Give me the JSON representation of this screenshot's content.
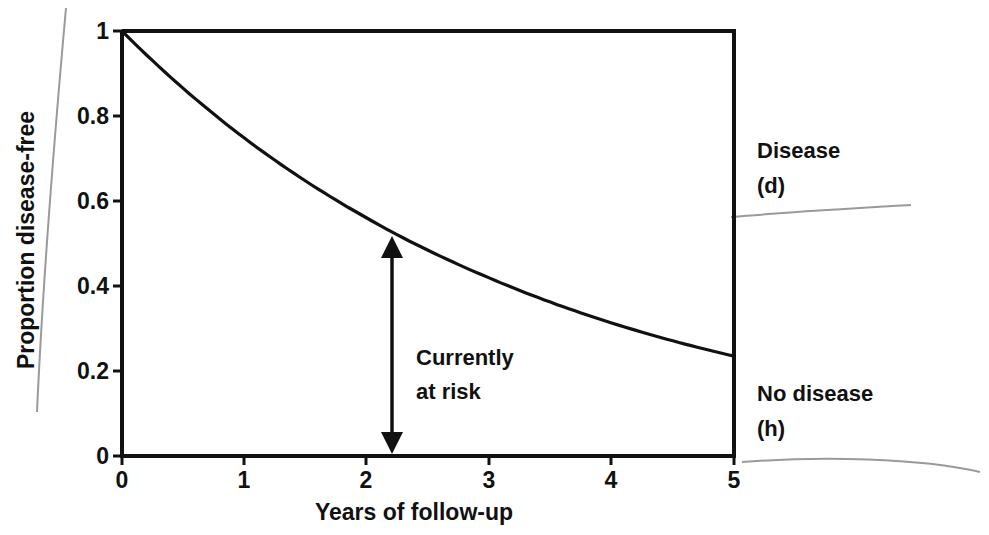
{
  "chart_data": {
    "type": "line",
    "title": "",
    "xlabel": "Years of follow-up",
    "ylabel": "Proportion disease-free",
    "xlim": [
      0,
      5
    ],
    "ylim": [
      0,
      1
    ],
    "x_ticks": [
      "0",
      "1",
      "2",
      "3",
      "4",
      "5"
    ],
    "y_ticks": [
      "0",
      "0.2",
      "0.4",
      "0.6",
      "0.8",
      "1"
    ],
    "grid": false,
    "legend": null,
    "series": [
      {
        "name": "Survival curve (proportion disease-free)",
        "x": [
          0,
          0.5,
          1,
          1.5,
          2,
          2.2,
          2.5,
          3,
          3.5,
          4,
          4.5,
          5
        ],
        "values": [
          1.0,
          0.865,
          0.748,
          0.647,
          0.56,
          0.528,
          0.484,
          0.419,
          0.362,
          0.313,
          0.271,
          0.235
        ]
      }
    ],
    "annotations": [
      {
        "type": "double-arrow",
        "x": 2.2,
        "y_from": 0,
        "y_to": 0.528,
        "label": "Currently at risk"
      },
      {
        "type": "side-label",
        "text": "Disease (d)",
        "position": "right, upper region"
      },
      {
        "type": "side-label",
        "text": "No disease (h)",
        "position": "right, lower region"
      }
    ]
  },
  "labels": {
    "xlabel": "Years of follow-up",
    "ylabel": "Proportion disease-free",
    "x_ticks": [
      "0",
      "1",
      "2",
      "3",
      "4",
      "5"
    ],
    "y_ticks": [
      "1",
      "0.8",
      "0.6",
      "0.4",
      "0.2",
      "0"
    ],
    "annotation_line1": "Currently",
    "annotation_line2": "at risk",
    "disease_line1": "Disease",
    "disease_line2": "(d)",
    "nodisease_line1": "No disease",
    "nodisease_line2": "(h)"
  },
  "colors": {
    "ink": "#111111",
    "pencil": "#9a9a9a",
    "background": "#ffffff"
  }
}
